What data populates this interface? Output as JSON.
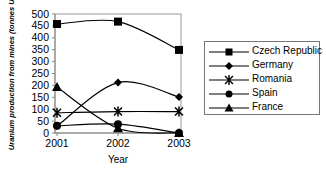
{
  "chart_data": {
    "type": "line",
    "title": "",
    "xlabel": "Year",
    "ylabel": "Uranium production from mines (tonnes U)",
    "x": [
      "2001",
      "2002",
      "2003"
    ],
    "ylim": [
      0,
      500
    ],
    "yticks": [
      0,
      50,
      100,
      150,
      200,
      250,
      300,
      350,
      400,
      450,
      500
    ],
    "grid": false,
    "legend_position": "right",
    "series": [
      {
        "name": "Czech Republic",
        "marker": "square",
        "values": [
          458,
          468,
          349
        ]
      },
      {
        "name": "Germany",
        "marker": "diamond",
        "values": [
          29,
          212,
          151
        ]
      },
      {
        "name": "Romania",
        "marker": "star",
        "values": [
          85,
          90,
          90
        ]
      },
      {
        "name": "Spain",
        "marker": "circle",
        "values": [
          30,
          37,
          0
        ]
      },
      {
        "name": "France",
        "marker": "triangle",
        "values": [
          193,
          20,
          0
        ]
      }
    ]
  }
}
